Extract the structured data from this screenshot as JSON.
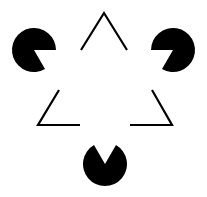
{
  "figure": {
    "title": "Kanizsa triangle illusion",
    "background": "#ffffff",
    "ink": "#000000",
    "stroke_width": 2.2,
    "pacmen": [
      {
        "name": "left",
        "cx": 34,
        "cy": 50,
        "r": 22
      },
      {
        "name": "right",
        "cx": 173,
        "cy": 50,
        "r": 22
      },
      {
        "name": "bottom",
        "cx": 105,
        "cy": 164,
        "r": 22
      }
    ],
    "outline_corners": [
      {
        "name": "top",
        "points": "81,50 104,13 127,50"
      },
      {
        "name": "lower-left",
        "points": "59,90 38,125 80,125"
      },
      {
        "name": "lower-right",
        "points": "152,90 172,125 130,125"
      }
    ]
  }
}
